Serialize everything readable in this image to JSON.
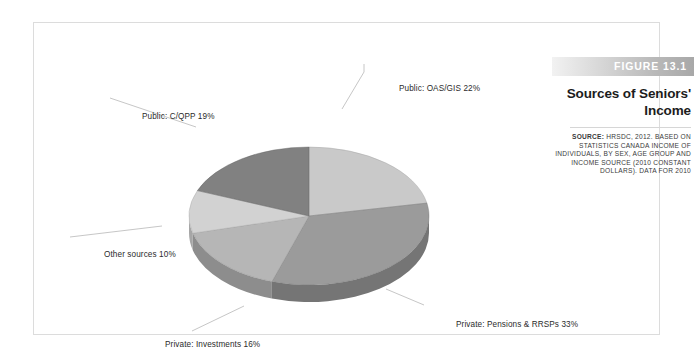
{
  "figure": {
    "banner_label": "FIGURE 13.1",
    "title": "Sources of Seniors' Income",
    "source_prefix": "SOURCE:",
    "source_body": " HRSDC, 2012. BASED ON STATISTICS CANADA INCOME OF INDIVIDUALS, BY SEX, AGE GROUP AND INCOME SOURCE (2010 CONSTANT DOLLARS). DATA FOR 2010"
  },
  "labels": {
    "oas": "Public: OAS/GIS 22%",
    "cqpp": "Public: C/QPP 19%",
    "other": "Other sources 10%",
    "investments": "Private: Investments 16%",
    "pensions": "Private: Pensions & RRSPs 33%"
  },
  "chart_data": {
    "type": "pie",
    "title": "Sources of Seniors' Income",
    "xlabel": "",
    "ylabel": "",
    "unit": "%",
    "three_d": true,
    "start_angle_deg": -90,
    "direction": "clockwise",
    "legend": "none",
    "labels_position": "external-with-leader-lines",
    "categories": [
      "Public: OAS/GIS",
      "Private: Pensions & RRSPs",
      "Private: Investments",
      "Other sources",
      "Public: C/QPP"
    ],
    "values": [
      22,
      33,
      16,
      10,
      19
    ],
    "data_labels": [
      "Public: OAS/GIS 22%",
      "Private: Pensions & RRSPs 33%",
      "Private: Investments 16%",
      "Other sources 10%",
      "Public: C/QPP 19%"
    ],
    "total": 100,
    "colors": [
      "#c9c9c9",
      "#9b9b9b",
      "#b6b6b6",
      "#d2d2d2",
      "#818181"
    ],
    "rim_colors": [
      "#9d9d9d",
      "#757575",
      "#8d8d8d",
      "#a6a6a6",
      "#5f5f5f"
    ]
  },
  "palette": {
    "banner_gradient_start": "#f2f2f2",
    "banner_gradient_end": "#a8a8a8",
    "box_border": "#dcdcdc",
    "text": "#1c1c1c",
    "leader_line": "#c0c0c0"
  }
}
